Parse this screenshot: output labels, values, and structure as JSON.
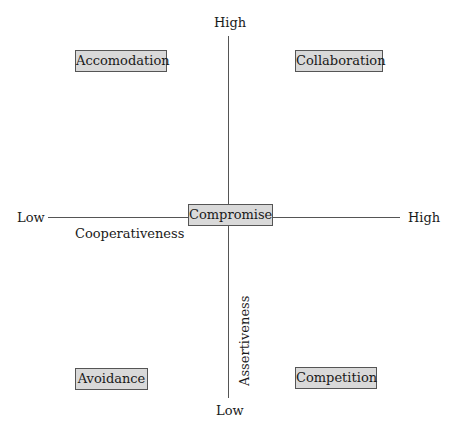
{
  "diagram": {
    "vertical_axis": {
      "name": "Assertiveness",
      "high_label": "High",
      "low_label": "Low"
    },
    "horizontal_axis": {
      "name": "Cooperativeness",
      "low_label": "Low",
      "high_label": "High"
    },
    "quadrants": {
      "top_left": "Accomodation",
      "top_right": "Collaboration",
      "center": "Compromise",
      "bottom_left": "Avoidance",
      "bottom_right": "Competition"
    },
    "colors": {
      "box_fill": "#d9d9d9",
      "box_border": "#555555",
      "axis": "#555555",
      "text": "#1a1a1a"
    }
  }
}
